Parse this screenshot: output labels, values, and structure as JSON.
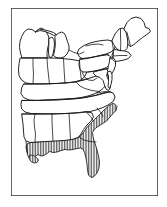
{
  "figure": {
    "type": "line-art-map",
    "region": "Eastern United States",
    "background_color": "#ffffff",
    "outline_color": "#1a1a1a",
    "hatch_color": "#2b2b2b",
    "frame_color": "#3c3c3c",
    "frame": {
      "x": 11,
      "y": 8,
      "width": 147,
      "height": 188,
      "stroke_width": 1.6
    },
    "caption": "",
    "legend": "",
    "hatching": {
      "pattern": "vertical-lines",
      "spacing_px": 1.6,
      "stroke_width": 0.7,
      "meaning": "shaded distribution / range area",
      "areas": [
        "Florida peninsula",
        "Atlantic coastal plain of Georgia and the Carolinas",
        "Gulf coastal plain of Alabama, Mississippi and Louisiana"
      ]
    },
    "features": [
      "Great Lakes shoreline",
      "Lake Michigan",
      "Maine northeastern tip",
      "Chesapeake Bay",
      "Florida peninsula",
      "Mississippi River delta",
      "state boundary lines"
    ]
  },
  "chart_data": {
    "type": "map",
    "projection": "simple outline",
    "shaded_states": [
      "Florida",
      "Georgia",
      "South Carolina",
      "North Carolina",
      "Alabama",
      "Mississippi",
      "Louisiana"
    ],
    "unshaded_states": [
      "Maine",
      "New Hampshire",
      "Vermont",
      "New York",
      "Massachusetts",
      "Connecticut",
      "Rhode Island",
      "Pennsylvania",
      "New Jersey",
      "Delaware",
      "Maryland",
      "Virginia",
      "West Virginia",
      "Ohio",
      "Michigan",
      "Indiana",
      "Illinois",
      "Wisconsin",
      "Kentucky",
      "Tennessee",
      "Missouri",
      "Arkansas"
    ]
  }
}
